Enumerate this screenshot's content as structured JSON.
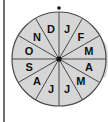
{
  "spinner": {
    "title": "Month spinner",
    "sections": [
      {
        "label": "J",
        "month": "January"
      },
      {
        "label": "F",
        "month": "February"
      },
      {
        "label": "M",
        "month": "March"
      },
      {
        "label": "A",
        "month": "April"
      },
      {
        "label": "M",
        "month": "May"
      },
      {
        "label": "J",
        "month": "June"
      },
      {
        "label": "J",
        "month": "July"
      },
      {
        "label": "A",
        "month": "August"
      },
      {
        "label": "S",
        "month": "September"
      },
      {
        "label": "O",
        "month": "October"
      },
      {
        "label": "N",
        "month": "November"
      },
      {
        "label": "D",
        "month": "December"
      }
    ],
    "colors": {
      "fill": "#d6d6d6",
      "stroke": "#4a4a4a",
      "center": "#111111",
      "pointer": "#111111"
    }
  }
}
